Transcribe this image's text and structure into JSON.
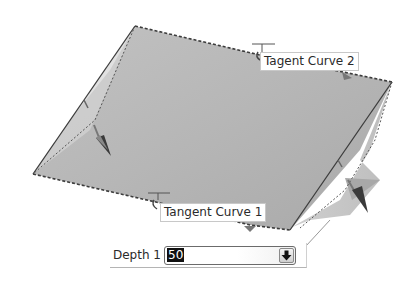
{
  "viewport": {
    "surface_color": "#b9b9b9",
    "edge_color": "#4a4a4a"
  },
  "callouts": {
    "tangent_curve_2": "Tagent Curve 2",
    "tangent_curve_1": "Tangent Curve 1"
  },
  "depth": {
    "label": "Depth 1",
    "value": "50",
    "dropdown_icon": "down-arrow-icon"
  }
}
